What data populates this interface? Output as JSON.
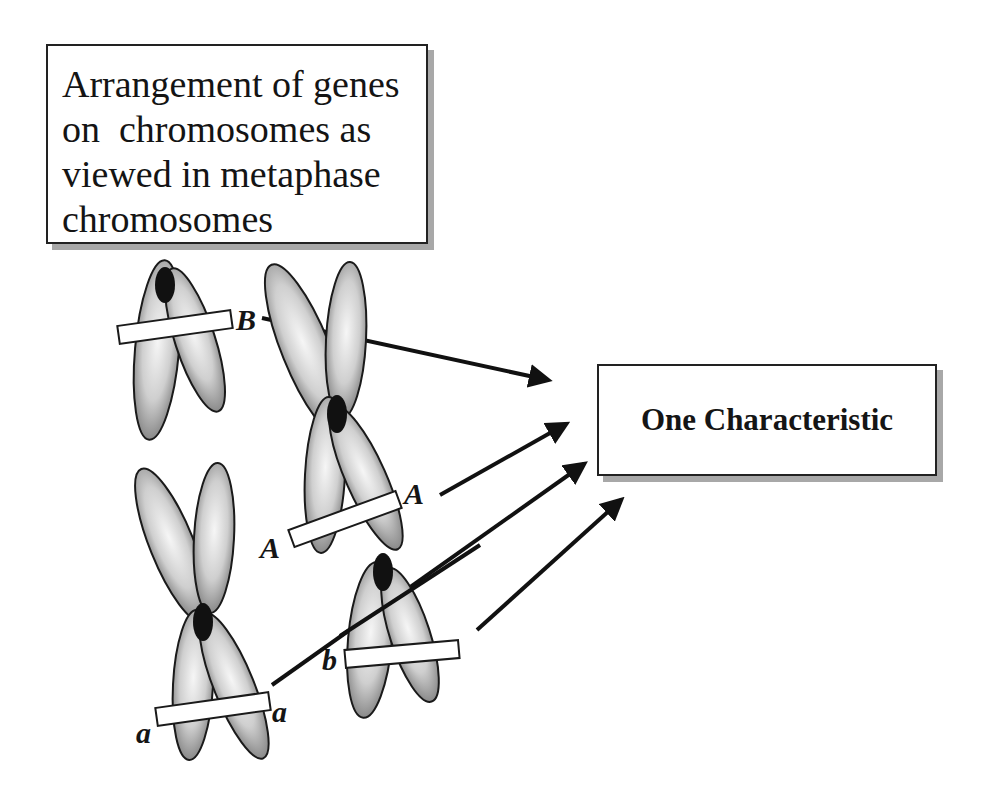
{
  "title_box": {
    "lines": [
      "Arrangement of genes",
      "on  chromosomes as",
      "viewed in metaphase",
      "chromosomes"
    ]
  },
  "result_box": {
    "label": "One Characteristic"
  },
  "gene_labels": {
    "B": "B",
    "A_right": "A",
    "A_left": "A",
    "a_left": "a",
    "a_right": "a",
    "b": "b"
  },
  "colors": {
    "chromatid_dark": "#7a7a7a",
    "chromatid_light": "#f2f2f2",
    "centromere": "#111111",
    "outline": "#1a1a1a",
    "box_shadow": "#a8a8a8"
  }
}
